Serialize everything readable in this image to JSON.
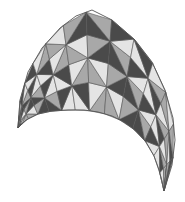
{
  "figure": {
    "width": 185,
    "height": 202,
    "background": "#ffffff",
    "stroke_color": "#555555",
    "shades": {
      "light": "#e4e4e4",
      "mid": "#a8a8a8",
      "dark": "#4a4a4a"
    },
    "outer_boundary": [
      [
        18,
        128
      ],
      [
        20,
        100
      ],
      [
        28,
        72
      ],
      [
        42,
        48
      ],
      [
        60,
        28
      ],
      [
        76,
        16
      ],
      [
        92,
        10
      ],
      [
        112,
        20
      ],
      [
        135,
        40
      ],
      [
        152,
        62
      ],
      [
        165,
        90
      ],
      [
        173,
        118
      ],
      [
        175,
        140
      ],
      [
        172,
        165
      ],
      [
        164,
        191
      ]
    ],
    "inner_boundary": [
      [
        18,
        128
      ],
      [
        26,
        120
      ],
      [
        38,
        114
      ],
      [
        52,
        111
      ],
      [
        68,
        110
      ],
      [
        84,
        110
      ],
      [
        98,
        112
      ],
      [
        112,
        116
      ],
      [
        124,
        122
      ],
      [
        136,
        131
      ],
      [
        146,
        142
      ],
      [
        154,
        156
      ],
      [
        159,
        170
      ],
      [
        162,
        181
      ],
      [
        164,
        191
      ]
    ],
    "rows": 4
  }
}
